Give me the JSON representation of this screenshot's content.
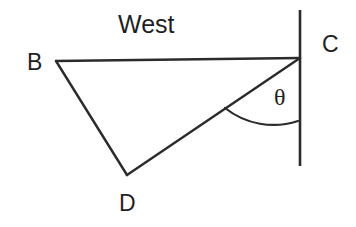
{
  "figure": {
    "type": "geometry-diagram",
    "background_color": "#ffffff",
    "stroke_color": "#2b2b2b",
    "text_color": "#1f1f1f",
    "labels": {
      "vertex_b": "B",
      "vertex_c": "C",
      "vertex_d": "D",
      "direction_west": "West",
      "angle_theta": "θ"
    },
    "points": {
      "B": {
        "x": 56,
        "y": 61
      },
      "C": {
        "x": 300,
        "y": 58
      },
      "D": {
        "x": 127,
        "y": 175
      }
    },
    "reference_line": {
      "name": "north-south-reference-line",
      "x": 300,
      "y_top": 10,
      "y_bottom": 166
    },
    "segments": [
      {
        "name": "segment-BC",
        "from": "B",
        "to": "C"
      },
      {
        "name": "segment-BD",
        "from": "B",
        "to": "D"
      },
      {
        "name": "segment-DC",
        "from": "D",
        "to": "C"
      }
    ],
    "angle_arc": {
      "name": "angle-arc-theta",
      "vertex": "C",
      "between": [
        "segment-DC",
        "north-south-reference-line"
      ],
      "start": {
        "x": 225,
        "y": 108
      },
      "end": {
        "x": 298,
        "y": 121
      },
      "radius": 78
    }
  }
}
